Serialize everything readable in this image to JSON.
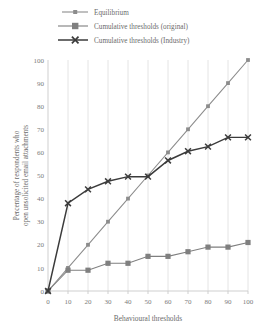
{
  "chart_data": {
    "type": "line",
    "title": "",
    "xlabel": "Behavioural thresholds",
    "ylabel": "Percentage of respondents who open unsolicited email attachments",
    "x": [
      0,
      10,
      20,
      30,
      40,
      50,
      60,
      70,
      80,
      90,
      100
    ],
    "xlim": [
      0,
      100
    ],
    "ylim": [
      0,
      100
    ],
    "xticks": [
      "0",
      "10",
      "20",
      "30",
      "40",
      "50",
      "60",
      "70",
      "80",
      "90",
      "100"
    ],
    "yticks": [
      "0",
      "10",
      "20",
      "30",
      "40",
      "50",
      "60",
      "70",
      "80",
      "90",
      "100"
    ],
    "grid": "vertical",
    "legend_position": "top",
    "series": [
      {
        "name": "Equilibrium",
        "values": [
          0,
          10,
          20,
          30,
          40,
          50,
          60,
          70,
          80,
          90,
          100
        ],
        "color": "#8c8c8c",
        "marker": "square"
      },
      {
        "name": "Cumulative thresholds (original)",
        "values": [
          0,
          9,
          9,
          12,
          12,
          15,
          15,
          17,
          19,
          19,
          21
        ],
        "color": "#7f7f7f",
        "marker": "square-large"
      },
      {
        "name": "Cumulative thresholds (Industry)",
        "values": [
          0,
          38,
          44,
          47.5,
          49.5,
          49.5,
          56.5,
          60.5,
          62.5,
          66.5,
          66.5
        ],
        "color": "#3b3b3b",
        "marker": "cross"
      }
    ]
  },
  "legend": {
    "items": [
      {
        "label": "Equilibrium"
      },
      {
        "label": "Cumulative thresholds (original)"
      },
      {
        "label": "Cumulative thresholds (Industry)"
      }
    ]
  },
  "axes": {
    "x_title": "Behavioural thresholds",
    "y_title_line1": "Percentage of respondents who",
    "y_title_line2": "open unsolicited email attachments"
  }
}
